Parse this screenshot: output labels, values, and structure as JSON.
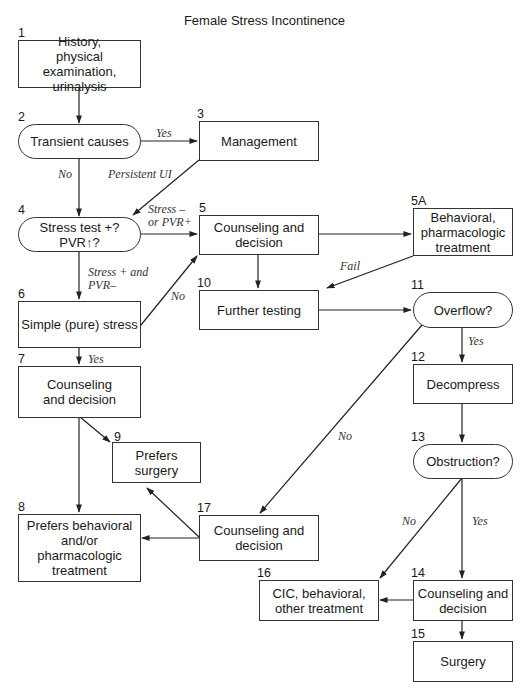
{
  "title": "Female Stress Incontinence",
  "nodes": {
    "n1": {
      "number": "1",
      "text": "History,\nphysical examination,\nurinalysis",
      "shape": "rect"
    },
    "n2": {
      "number": "2",
      "text": "Transient causes",
      "shape": "rounded"
    },
    "n3": {
      "number": "3",
      "text": "Management",
      "shape": "rect"
    },
    "n4": {
      "number": "4",
      "text": "Stress test +?\nPVR↑?",
      "shape": "rounded"
    },
    "n5": {
      "number": "5",
      "text": "Counseling and\ndecision",
      "shape": "rect"
    },
    "n5a": {
      "number": "5A",
      "text": "Behavioral,\npharmacologic\ntreatment",
      "shape": "rect"
    },
    "n6": {
      "number": "6",
      "text": "Simple (pure) stress",
      "shape": "rect"
    },
    "n7": {
      "number": "7",
      "text": "Counseling\nand decision",
      "shape": "rect"
    },
    "n8": {
      "number": "8",
      "text": "Prefers behavioral\nand/or\npharmacologic\ntreatment",
      "shape": "rect"
    },
    "n9": {
      "number": "9",
      "text": "Prefers\nsurgery",
      "shape": "rect"
    },
    "n10": {
      "number": "10",
      "text": "Further testing",
      "shape": "rect"
    },
    "n11": {
      "number": "11",
      "text": "Overflow?",
      "shape": "rounded"
    },
    "n12": {
      "number": "12",
      "text": "Decompress",
      "shape": "rect"
    },
    "n13": {
      "number": "13",
      "text": "Obstruction?",
      "shape": "rounded"
    },
    "n14": {
      "number": "14",
      "text": "Counseling and\ndecision",
      "shape": "rect"
    },
    "n15": {
      "number": "15",
      "text": "Surgery",
      "shape": "rect"
    },
    "n16": {
      "number": "16",
      "text": "CIC, behavioral,\nother treatment",
      "shape": "rect"
    },
    "n17": {
      "number": "17",
      "text": "Counseling and\ndecision",
      "shape": "rect"
    }
  },
  "edge_labels": {
    "e2_3": "Yes",
    "e2_4": "No",
    "e3_4": "Persistent UI",
    "e4_5": "Stress –\nor PVR+",
    "e4_6": "Stress + and\nPVR–",
    "e6_5": "No",
    "e5a_10": "Fail",
    "e6_7": "Yes",
    "e11_12": "Yes",
    "e11_17": "No",
    "e13_16": "No",
    "e13_14": "Yes"
  },
  "edges": [
    {
      "from": "1",
      "to": "2"
    },
    {
      "from": "2",
      "to": "3",
      "label": "Yes"
    },
    {
      "from": "2",
      "to": "4",
      "label": "No"
    },
    {
      "from": "3",
      "to": "4",
      "label": "Persistent UI"
    },
    {
      "from": "4",
      "to": "5",
      "label": "Stress – or PVR+"
    },
    {
      "from": "4",
      "to": "6",
      "label": "Stress + and PVR–"
    },
    {
      "from": "5",
      "to": "5A"
    },
    {
      "from": "5",
      "to": "10"
    },
    {
      "from": "5A",
      "to": "10",
      "label": "Fail"
    },
    {
      "from": "6",
      "to": "5",
      "label": "No"
    },
    {
      "from": "6",
      "to": "7",
      "label": "Yes"
    },
    {
      "from": "7",
      "to": "8"
    },
    {
      "from": "7",
      "to": "9"
    },
    {
      "from": "10",
      "to": "11"
    },
    {
      "from": "11",
      "to": "12",
      "label": "Yes"
    },
    {
      "from": "11",
      "to": "17",
      "label": "No"
    },
    {
      "from": "12",
      "to": "13"
    },
    {
      "from": "13",
      "to": "14",
      "label": "Yes"
    },
    {
      "from": "13",
      "to": "16",
      "label": "No"
    },
    {
      "from": "14",
      "to": "15"
    },
    {
      "from": "14",
      "to": "16"
    },
    {
      "from": "17",
      "to": "8"
    },
    {
      "from": "17",
      "to": "9"
    }
  ]
}
